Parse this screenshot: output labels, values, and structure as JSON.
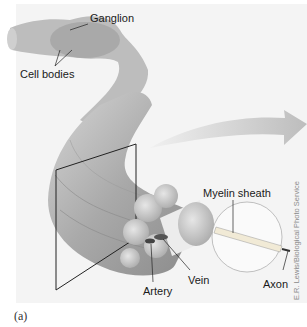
{
  "figure": {
    "caption": "(a)",
    "credit": "E.R. Lewis/Biological Photo Service",
    "labels": {
      "ganglion": "Ganglion",
      "cell_bodies": "Cell bodies",
      "myelin_sheath": "Myelin sheath",
      "axon": "Axon",
      "vein": "Vein",
      "artery": "Artery"
    },
    "colors": {
      "background": "#f4f4f4",
      "nerve": "#b8b8b8",
      "nerve_dark": "#8c8c8c",
      "fascicle": "#d8d8d8",
      "arrow": "#c9c9c9",
      "line": "#222222"
    }
  }
}
